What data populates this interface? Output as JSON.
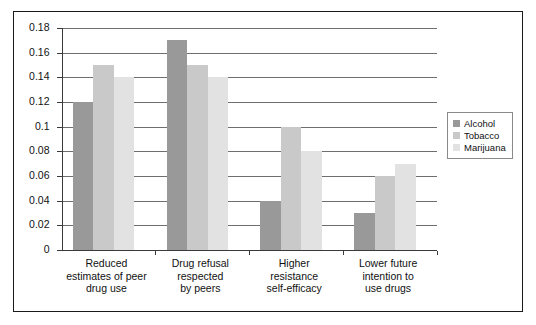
{
  "chart_data": {
    "type": "bar",
    "title": "",
    "xlabel": "",
    "ylabel": "",
    "ylim": [
      0,
      0.18
    ],
    "grid": true,
    "legend_position": "right",
    "categories": [
      "Reduced estimates of peer drug use",
      "Drug refusal respected by peers",
      "Higher resistance self-efficacy",
      "Lower future intention to use drugs"
    ],
    "category_lines": [
      [
        "Reduced",
        "estimates of peer",
        "drug use"
      ],
      [
        "Drug refusal",
        "respected",
        "by peers"
      ],
      [
        "Higher",
        "resistance",
        "self-efficacy"
      ],
      [
        "Lower future",
        "intention to",
        "use drugs"
      ]
    ],
    "series": [
      {
        "name": "Alcohol",
        "color": "#999999",
        "values": [
          0.12,
          0.17,
          0.04,
          0.03
        ]
      },
      {
        "name": "Tobacco",
        "color": "#c9c9c9",
        "values": [
          0.15,
          0.15,
          0.1,
          0.06
        ]
      },
      {
        "name": "Marijuana",
        "color": "#e2e2e2",
        "values": [
          0.14,
          0.14,
          0.08,
          0.07
        ]
      }
    ],
    "yticks": [
      0,
      0.02,
      0.04,
      0.06,
      0.08,
      0.1,
      0.12,
      0.14,
      0.16,
      0.18
    ],
    "ytick_labels": [
      "0",
      "0.02",
      "0.04",
      "0.06",
      "0.08",
      "0.1",
      "0.12",
      "0.14",
      "0.16",
      "0.18"
    ]
  },
  "legend": {
    "items": [
      {
        "label": "Alcohol",
        "color": "#999999"
      },
      {
        "label": "Tobacco",
        "color": "#c9c9c9"
      },
      {
        "label": "Marijuana",
        "color": "#e2e2e2"
      }
    ]
  }
}
